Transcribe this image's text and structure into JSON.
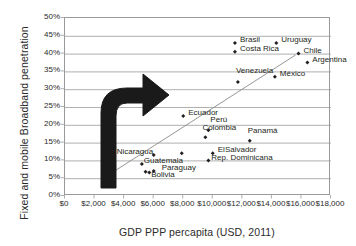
{
  "chart_data": {
    "type": "scatter",
    "title": "",
    "xlabel": "GDP PPP percapita (USD, 2011)",
    "ylabel": "Fixed and mobile Broadband penetration",
    "xlim": [
      0,
      18000
    ],
    "ylim": [
      0,
      0.5
    ],
    "xticks": [
      "$0",
      "$2,000",
      "$4,000",
      "$6,000",
      "$8,000",
      "$10,000",
      "$12,000",
      "$14,000",
      "$16,000",
      "$18,000"
    ],
    "xtick_values": [
      0,
      2000,
      4000,
      6000,
      8000,
      10000,
      12000,
      14000,
      16000,
      18000
    ],
    "yticks": [
      "0%",
      "5%",
      "10%",
      "15%",
      "20%",
      "25%",
      "30%",
      "35%",
      "40%",
      "45%",
      "50%"
    ],
    "ytick_values": [
      0,
      5,
      10,
      15,
      20,
      25,
      30,
      35,
      40,
      45,
      50
    ],
    "grid": "horizontal",
    "legend": "none",
    "marker": "diamond",
    "marker_color": "#231f20",
    "points": [
      {
        "name": "Brasil",
        "x": 11500,
        "y": 43.0,
        "label_dx": 5,
        "label_dy": -4
      },
      {
        "name": "Costa Rica",
        "x": 11500,
        "y": 40.5,
        "label_dx": 5,
        "label_dy": -4
      },
      {
        "name": "Uruguay",
        "x": 14300,
        "y": 43.0,
        "label_dx": 5,
        "label_dy": -4
      },
      {
        "name": "Chile",
        "x": 15800,
        "y": 40.0,
        "label_dx": 5,
        "label_dy": -4
      },
      {
        "name": "Argentina",
        "x": 16400,
        "y": 37.5,
        "label_dx": 5,
        "label_dy": -4
      },
      {
        "name": "México",
        "x": 14200,
        "y": 33.5,
        "label_dx": 5,
        "label_dy": -4
      },
      {
        "name": "Venezuela",
        "x": 11700,
        "y": 32.0,
        "label_dx": -2,
        "label_dy": -12
      },
      {
        "name": "Ecuador",
        "x": 8000,
        "y": 22.5,
        "label_dx": 5,
        "label_dy": -4
      },
      {
        "name": "Perú",
        "x": 9700,
        "y": 18.5,
        "label_dx": 2,
        "label_dy": -11
      },
      {
        "name": "Colombia",
        "x": 9500,
        "y": 16.5,
        "label_dx": -3,
        "label_dy": -10
      },
      {
        "name": "Panamá",
        "x": 12500,
        "y": 15.5,
        "label_dx": -2,
        "label_dy": -11
      },
      {
        "name": "ElSalvador",
        "x": 10000,
        "y": 12.0,
        "label_dx": 5,
        "label_dy": -4
      },
      {
        "name": "Rep. Dominicana",
        "x": 9700,
        "y": 10.0,
        "label_dx": 3,
        "label_dy": -3
      },
      {
        "name": "Nicaragua",
        "x": 6000,
        "y": 11.5,
        "label_dx": -37,
        "label_dy": -4
      },
      {
        "name": "Guatemala",
        "x": 5200,
        "y": 9.0,
        "label_dx": 2,
        "label_dy": -4
      },
      {
        "name": "Paraguay",
        "x": 6000,
        "y": 7.0,
        "label_dx": 8,
        "label_dy": -4
      },
      {
        "name": "Bolivia",
        "x": 5700,
        "y": 6.6,
        "label_dx": 2,
        "label_dy": 1
      },
      {
        "name": "Honduras",
        "x": 5450,
        "y": 6.8,
        "label_dx": 0,
        "label_dy": 0,
        "hide_label": true
      },
      {
        "name": "Costa Rica2",
        "x": 7900,
        "y": 12.0,
        "label_dx": 0,
        "label_dy": 0,
        "hide_label": true
      }
    ],
    "trendline": {
      "x0": 2450,
      "y0": 4.6,
      "x1": 15600,
      "y1": 39.6,
      "color": "#8a8a8a"
    },
    "annotation_arrow": {
      "description": "curved-up-then-right black block arrow",
      "color": "#1a1a1a"
    }
  },
  "axes": {
    "y_title": "Fixed and mobile Broadband penetration",
    "x_title": "GDP PPP percapita (USD, 2011)"
  }
}
